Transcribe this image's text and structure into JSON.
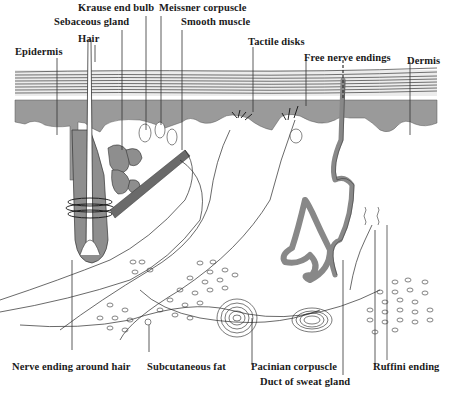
{
  "figure": {
    "colors": {
      "tissue_gray": "#9a9a9a",
      "line": "#2a2a2a",
      "background": "#ffffff"
    }
  },
  "labels": {
    "top": [
      {
        "id": "krause",
        "text": "Krause end bulb"
      },
      {
        "id": "meissner",
        "text": "Meissner corpuscle"
      },
      {
        "id": "sebaceous",
        "text": "Sebaceous gland"
      },
      {
        "id": "smooth_muscle",
        "text": "Smooth muscle"
      },
      {
        "id": "hair",
        "text": "Hair"
      },
      {
        "id": "epidermis",
        "text": "Epidermis"
      },
      {
        "id": "tactile",
        "text": "Tactile disks"
      },
      {
        "id": "free_nerve",
        "text": "Free nerve endings"
      },
      {
        "id": "dermis",
        "text": "Dermis"
      }
    ],
    "bottom": [
      {
        "id": "nerve_hair",
        "text": "Nerve ending around hair"
      },
      {
        "id": "subcutaneous",
        "text": "Subcutaneous fat"
      },
      {
        "id": "pacinian",
        "text": "Pacinian corpuscle"
      },
      {
        "id": "sweat_duct",
        "text": "Duct of sweat gland"
      },
      {
        "id": "ruffini",
        "text": "Ruffini ending"
      }
    ]
  }
}
